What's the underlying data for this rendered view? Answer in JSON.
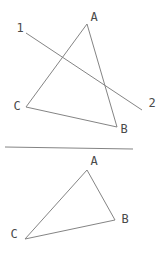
{
  "figure": {
    "stroke_color": "#848484",
    "label_color": "#4a4a4a",
    "background": "#ffffff",
    "top_diagram": {
      "triangle": {
        "points": [
          [
            87,
            24
          ],
          [
            117,
            127
          ],
          [
            26,
            107
          ]
        ]
      },
      "transversal": {
        "from": [
          26,
          33
        ],
        "to": [
          142,
          110
        ]
      },
      "labels": [
        {
          "id": "top-vertex-label-a",
          "text": "A",
          "x": 94,
          "y": 21
        },
        {
          "id": "transversal-label-1",
          "text": "1",
          "x": 20,
          "y": 32
        },
        {
          "id": "transversal-label-2",
          "text": "2",
          "x": 152,
          "y": 107
        },
        {
          "id": "top-vertex-label-c",
          "text": "C",
          "x": 17,
          "y": 110
        },
        {
          "id": "top-vertex-label-b",
          "text": "B",
          "x": 124,
          "y": 133
        }
      ]
    },
    "divider": {
      "from": [
        5,
        147
      ],
      "to": [
        133,
        149
      ]
    },
    "bottom_diagram": {
      "triangle": {
        "points": [
          [
            87,
            170
          ],
          [
            115,
            220
          ],
          [
            25,
            239
          ]
        ]
      },
      "labels": [
        {
          "id": "bottom-vertex-label-a",
          "text": "A",
          "x": 94,
          "y": 165
        },
        {
          "id": "bottom-vertex-label-b",
          "text": "B",
          "x": 125,
          "y": 223
        },
        {
          "id": "bottom-vertex-label-c",
          "text": "C",
          "x": 14,
          "y": 238
        }
      ]
    }
  }
}
